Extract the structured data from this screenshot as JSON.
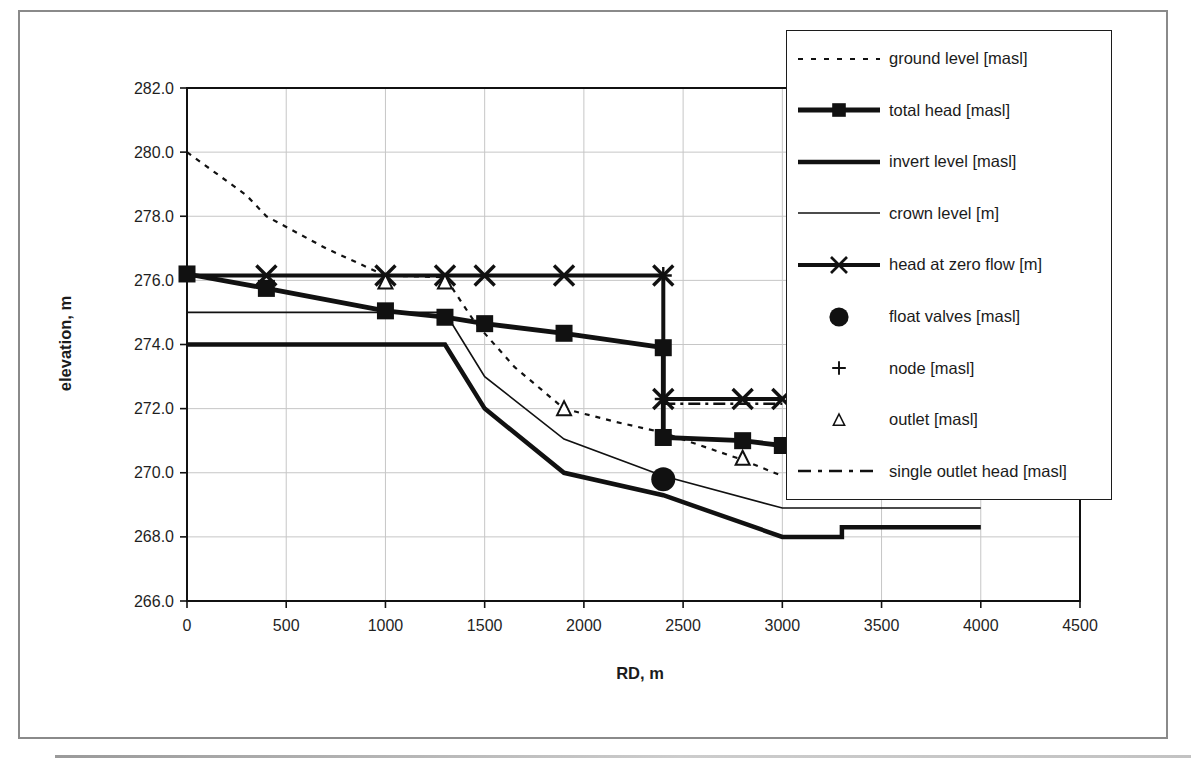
{
  "colors": {
    "ink": "#111111",
    "text": "#1f1f1f",
    "grid": "#c6c6c6",
    "legend_border": "#1c1c1c",
    "figure_border": "#8a8a8a",
    "background": "#ffffff"
  },
  "chart_data": {
    "type": "line",
    "title": "",
    "grid": "both",
    "legend_position": "top-right-overlapping-plot",
    "axes": {
      "x": {
        "label": "RD, m",
        "min": 0,
        "max": 4500,
        "ticks": [
          {
            "v": 0,
            "label": "0"
          },
          {
            "v": 500,
            "label": "500"
          },
          {
            "v": 1000,
            "label": "1000"
          },
          {
            "v": 1500,
            "label": "1500"
          },
          {
            "v": 2000,
            "label": "2000"
          },
          {
            "v": 2500,
            "label": "2500"
          },
          {
            "v": 3000,
            "label": "3000"
          },
          {
            "v": 3500,
            "label": "3500"
          },
          {
            "v": 4000,
            "label": "4000"
          },
          {
            "v": 4500,
            "label": "4500"
          }
        ]
      },
      "y": {
        "label": "elevation, m",
        "min": 266,
        "max": 282,
        "ticks": [
          {
            "v": 266,
            "label": "266.0"
          },
          {
            "v": 268,
            "label": "268.0"
          },
          {
            "v": 270,
            "label": "270.0"
          },
          {
            "v": 272,
            "label": "272.0"
          },
          {
            "v": 274,
            "label": "274.0"
          },
          {
            "v": 276,
            "label": "276.0"
          },
          {
            "v": 278,
            "label": "278.0"
          },
          {
            "v": 280,
            "label": "280.0"
          },
          {
            "v": 282,
            "label": "282.0"
          }
        ]
      }
    },
    "legend_order": [
      "ground_level",
      "total_head",
      "invert_level",
      "crown_level",
      "head_at_zero_flow",
      "float_valves",
      "node",
      "outlet",
      "single_outlet_head"
    ],
    "series": [
      {
        "id": "ground_level",
        "label": "ground level [masl]",
        "points": [
          [
            0,
            280.0
          ],
          [
            300,
            278.65
          ],
          [
            400,
            278.0
          ],
          [
            700,
            277.0
          ],
          [
            1000,
            276.15
          ],
          [
            1300,
            276.1
          ],
          [
            1450,
            274.7
          ],
          [
            1650,
            273.3
          ],
          [
            1900,
            272.0
          ],
          [
            2150,
            271.6
          ],
          [
            2400,
            271.25
          ],
          [
            2800,
            270.4
          ],
          [
            3000,
            269.9
          ]
        ],
        "style": {
          "width": 2.2,
          "dash": "5 6",
          "sample_dash": "5 8",
          "marker": "none"
        }
      },
      {
        "id": "crown_level",
        "label": "crown level [m]",
        "points": [
          [
            0,
            275.0
          ],
          [
            1300,
            275.0
          ],
          [
            1500,
            273.0
          ],
          [
            1900,
            271.05
          ],
          [
            2400,
            269.9
          ],
          [
            3000,
            268.9
          ],
          [
            4000,
            268.9
          ]
        ],
        "style": {
          "width": 1.7,
          "marker": "none"
        }
      },
      {
        "id": "invert_level",
        "label": "invert level [masl]",
        "points": [
          [
            0,
            274.0
          ],
          [
            1300,
            274.0
          ],
          [
            1500,
            272.0
          ],
          [
            1900,
            270.0
          ],
          [
            2400,
            269.3
          ],
          [
            3000,
            268.0
          ],
          [
            3300,
            268.0
          ],
          [
            3300,
            268.3
          ],
          [
            4000,
            268.3
          ]
        ],
        "style": {
          "width": 4.5,
          "marker": "none"
        }
      },
      {
        "id": "single_outlet_head",
        "label": "single outlet head [masl]",
        "points": [
          [
            2400,
            272.15
          ],
          [
            3000,
            272.15
          ]
        ],
        "style": {
          "width": 2.6,
          "dash": "12 5 3 5",
          "sample_dash": "13 7 4 7",
          "marker": "none"
        }
      },
      {
        "id": "head_at_zero_flow",
        "label": "head at zero flow [m]",
        "points": [
          [
            0,
            276.15
          ],
          [
            2400,
            276.15
          ],
          [
            2400,
            272.3
          ],
          [
            3000,
            272.3
          ]
        ],
        "marker_points": [
          [
            400,
            276.15
          ],
          [
            1000,
            276.15
          ],
          [
            1300,
            276.15
          ],
          [
            1500,
            276.15
          ],
          [
            1900,
            276.15
          ],
          [
            2400,
            276.15
          ],
          [
            2400,
            272.3
          ],
          [
            2800,
            272.3
          ],
          [
            3000,
            272.3
          ]
        ],
        "style": {
          "width": 4,
          "marker": "x"
        }
      },
      {
        "id": "node",
        "label": "node [masl]",
        "points": [
          [
            2400,
            276.15
          ],
          [
            2400,
            272.3
          ]
        ],
        "style": {
          "marker": "plus"
        }
      },
      {
        "id": "total_head",
        "label": "total head [masl]",
        "points": [
          [
            0,
            276.2
          ],
          [
            400,
            275.75
          ],
          [
            1000,
            275.05
          ],
          [
            1300,
            274.85
          ],
          [
            1500,
            274.65
          ],
          [
            1900,
            274.35
          ],
          [
            2400,
            273.9
          ],
          [
            2400,
            271.1
          ],
          [
            2800,
            271.0
          ],
          [
            3000,
            270.85
          ]
        ],
        "style": {
          "width": 4.8,
          "marker": "square"
        }
      },
      {
        "id": "outlet",
        "label": "outlet [masl]",
        "points": [
          [
            1000,
            275.95
          ],
          [
            1300,
            275.95
          ],
          [
            1900,
            272.0
          ],
          [
            2800,
            270.45
          ]
        ],
        "style": {
          "marker": "triangle"
        }
      },
      {
        "id": "float_valves",
        "label": "float valves [masl]",
        "points": [
          [
            2400,
            269.8
          ]
        ],
        "style": {
          "marker": "circle"
        }
      }
    ]
  }
}
